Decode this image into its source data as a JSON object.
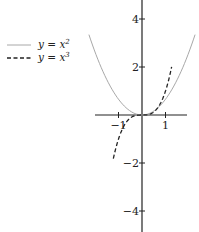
{
  "chart_data": {
    "type": "line",
    "title": "",
    "xlabel": "",
    "ylabel": "",
    "x_ticks": [
      -1,
      1
    ],
    "y_ticks": [
      4,
      2,
      -2,
      -4
    ],
    "x_tick_labels": [
      "−1",
      "1"
    ],
    "y_tick_labels": [
      "4",
      "2",
      "−2",
      "−4"
    ],
    "xlim": [
      -1.6,
      1.9
    ],
    "ylim": [
      -4.8,
      4.8
    ],
    "grid": false,
    "legend_position": "upper-left",
    "series": [
      {
        "name": "y = x^2",
        "label_base": "y = x",
        "label_exp": "2",
        "style": "solid",
        "color": "#a8a8a8",
        "x": [
          -1.83,
          -1.5,
          -1.0,
          -0.5,
          0,
          0.5,
          1.0,
          1.5,
          1.83
        ],
        "y": [
          3.35,
          2.25,
          1.0,
          0.25,
          0,
          0.25,
          1.0,
          2.25,
          3.35
        ]
      },
      {
        "name": "y = x^3",
        "label_base": "y = x",
        "label_exp": "3",
        "style": "dashed",
        "color": "#222222",
        "x": [
          -1.22,
          -1.0,
          -0.5,
          0,
          0.5,
          1.0,
          1.26
        ],
        "y": [
          -1.8,
          -1.0,
          -0.125,
          0,
          0.125,
          1.0,
          2.0
        ]
      }
    ]
  }
}
